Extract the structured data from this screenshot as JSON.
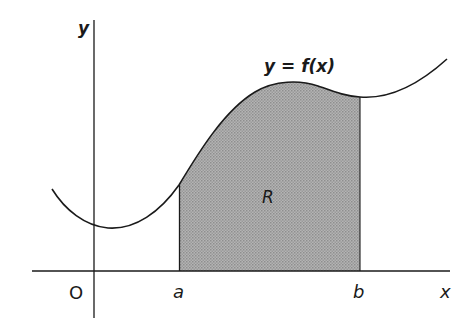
{
  "diagram": {
    "curve_label": "y = f(x)",
    "region_label": "R",
    "axes": {
      "x_label": "x",
      "y_label": "y",
      "origin_label": "O"
    },
    "bounds": {
      "lower": "a",
      "upper": "b"
    },
    "colors": {
      "line": "#1a1a1a",
      "shade": "#a8a8a8",
      "background": "#ffffff"
    }
  }
}
